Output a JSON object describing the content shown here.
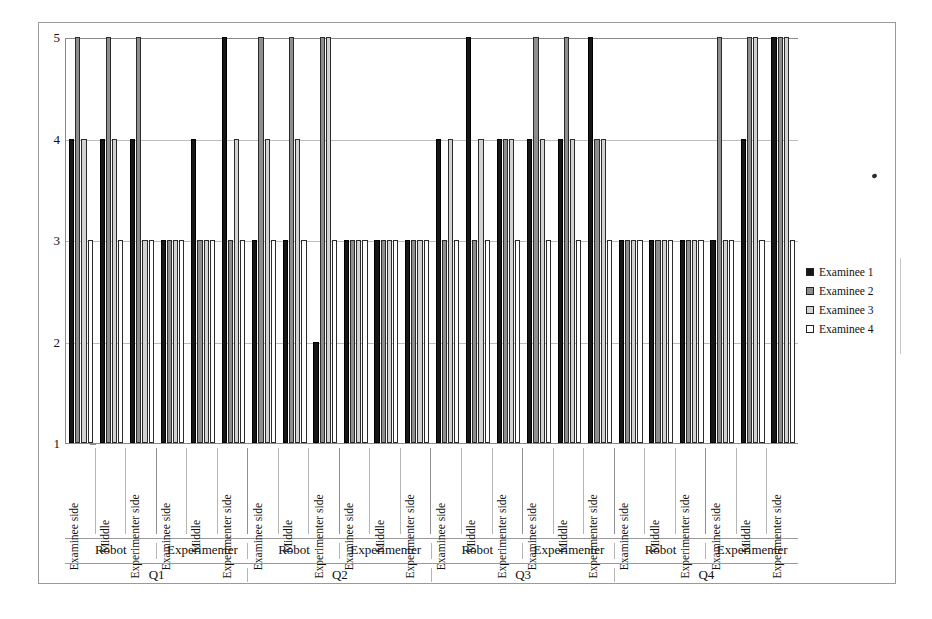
{
  "chart_data": {
    "type": "bar",
    "title": "",
    "xlabel": "",
    "ylabel": "",
    "ylim": [
      1,
      5
    ],
    "yticks": [
      1,
      2,
      3,
      4,
      5
    ],
    "grid": true,
    "legend_position": "right",
    "legend": [
      "Examinee 1",
      "Examinee 2",
      "Examinee 3",
      "Examinee 4"
    ],
    "series_colors": [
      "#161616",
      "#8e8e8e",
      "#d2d2d2",
      "#ffffff"
    ],
    "axis_level_names": [
      "position",
      "agent",
      "question"
    ],
    "questions": [
      "Q1",
      "Q2",
      "Q3",
      "Q4"
    ],
    "agents": [
      "Robot",
      "Experimenter"
    ],
    "positions": [
      "Examinee side",
      "Middle",
      "Experimenter side"
    ],
    "categories": [
      "Q1 / Robot / Examinee side",
      "Q1 / Robot / Middle",
      "Q1 / Robot / Experimenter side",
      "Q1 / Experimenter / Examinee side",
      "Q1 / Experimenter / Middle",
      "Q1 / Experimenter / Experimenter side",
      "Q2 / Robot / Examinee side",
      "Q2 / Robot / Middle",
      "Q2 / Robot / Experimenter side",
      "Q2 / Experimenter / Examinee side",
      "Q2 / Experimenter / Middle",
      "Q2 / Experimenter / Experimenter side",
      "Q3 / Robot / Examinee side",
      "Q3 / Robot / Middle",
      "Q3 / Robot / Experimenter side",
      "Q3 / Experimenter / Examinee side",
      "Q3 / Experimenter / Middle",
      "Q3 / Experimenter / Experimenter side",
      "Q4 / Robot / Examinee side",
      "Q4 / Robot / Middle",
      "Q4 / Robot / Experimenter side",
      "Q4 / Experimenter / Examinee side",
      "Q4 / Experimenter / Middle",
      "Q4 / Experimenter / Experimenter side"
    ],
    "series": [
      {
        "name": "Examinee 1",
        "color": "#161616",
        "values": [
          4,
          4,
          4,
          3,
          4,
          5,
          3,
          3,
          2,
          3,
          3,
          3,
          4,
          5,
          4,
          4,
          4,
          5,
          3,
          3,
          3,
          3,
          4,
          5
        ]
      },
      {
        "name": "Examinee 2",
        "color": "#8e8e8e",
        "values": [
          5,
          5,
          5,
          3,
          3,
          3,
          5,
          5,
          5,
          3,
          3,
          3,
          3,
          3,
          4,
          5,
          5,
          4,
          3,
          3,
          3,
          5,
          5,
          5
        ]
      },
      {
        "name": "Examinee 3",
        "color": "#d2d2d2",
        "values": [
          4,
          4,
          3,
          3,
          3,
          4,
          4,
          4,
          5,
          3,
          3,
          3,
          4,
          4,
          4,
          4,
          4,
          4,
          3,
          3,
          3,
          3,
          5,
          5
        ]
      },
      {
        "name": "Examinee 4",
        "color": "#ffffff",
        "values": [
          3,
          3,
          3,
          3,
          3,
          3,
          3,
          3,
          3,
          3,
          3,
          3,
          3,
          3,
          3,
          3,
          3,
          3,
          3,
          3,
          3,
          3,
          3,
          3
        ]
      }
    ]
  }
}
